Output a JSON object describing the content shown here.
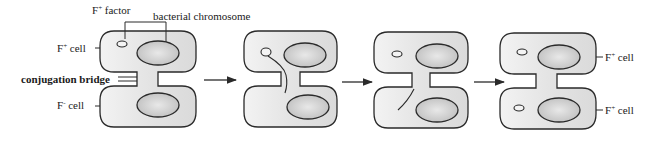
{
  "diagram": {
    "labels": {
      "f_plus_factor": {
        "base": "F",
        "sup": "+",
        "rest": " factor"
      },
      "bacterial_chromosome": "bacterial chromosome",
      "f_plus_cell_left": {
        "base": "F",
        "sup": "+",
        "rest": " cell"
      },
      "conjugation_bridge": "conjugation bridge",
      "f_minus_cell_left": {
        "base": "F",
        "sup": "-",
        "rest": " cell"
      },
      "f_plus_cell_right_top": {
        "base": "F",
        "sup": "+",
        "rest": " cell"
      },
      "f_plus_cell_right_bottom": {
        "base": "F",
        "sup": "+",
        "rest": " cell"
      }
    },
    "stages": [
      {
        "id": 1,
        "description": "F+ cell with F factor connected to F- cell by conjugation bridge"
      },
      {
        "id": 2,
        "description": "F factor single strand transferring through bridge"
      },
      {
        "id": 3,
        "description": "Strand enters recipient cell"
      },
      {
        "id": 4,
        "description": "Both cells now F+ with F factor"
      }
    ],
    "arrows": 3,
    "colors": {
      "outline": "#2a2a2a",
      "cell_fill": "#e6e6e6",
      "nucleoid_fill": "#c8c8c8",
      "background": "#ffffff"
    }
  }
}
